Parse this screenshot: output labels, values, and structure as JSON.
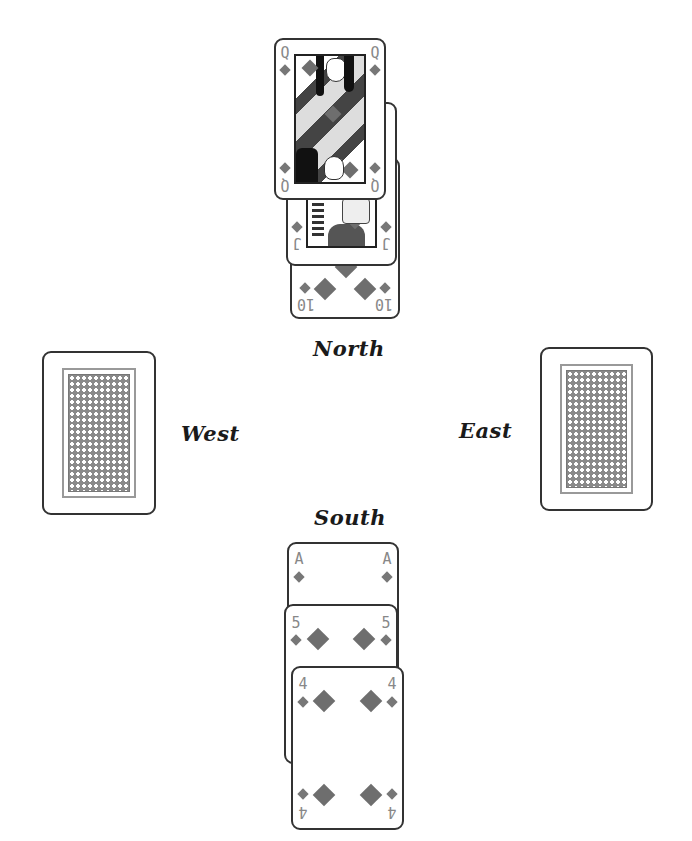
{
  "players": {
    "north": {
      "label": "North"
    },
    "west": {
      "label": "West"
    },
    "east": {
      "label": "East"
    },
    "south": {
      "label": "South"
    }
  },
  "north_cards": [
    {
      "rank": "10",
      "suit": "diamonds"
    },
    {
      "rank": "J",
      "suit": "diamonds"
    },
    {
      "rank": "Q",
      "suit": "diamonds"
    }
  ],
  "south_cards": [
    {
      "rank": "A",
      "suit": "diamonds"
    },
    {
      "rank": "5",
      "suit": "diamonds"
    },
    {
      "rank": "4",
      "suit": "diamonds"
    }
  ],
  "west_card": {
    "face": "down"
  },
  "east_card": {
    "face": "down"
  },
  "colors": {
    "suit": "#6e6e6e",
    "index": "#888888",
    "border": "#333333"
  }
}
